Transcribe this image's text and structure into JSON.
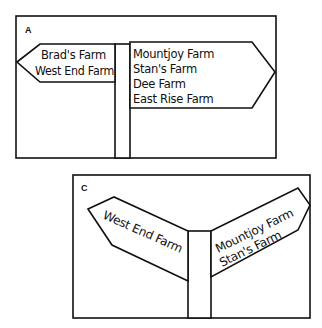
{
  "panels": [
    {
      "label": "A",
      "signs": {
        "left": {
          "direction": "left",
          "lines": [
            "Brad's Farm",
            "West End Farm"
          ]
        },
        "right": {
          "direction": "right",
          "lines": [
            "Mountjoy Farm",
            "Stan's Farm",
            "Dee Farm",
            "East Rise Farm"
          ]
        }
      }
    },
    {
      "label": "C",
      "signs": {
        "left": {
          "direction": "left",
          "lines": [
            "West End Farm"
          ]
        },
        "right": {
          "direction": "right",
          "lines": [
            "Mountjoy Farm",
            "Stan's Farm"
          ]
        }
      }
    }
  ]
}
